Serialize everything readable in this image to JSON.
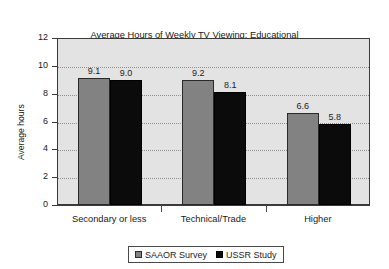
{
  "chart_data": {
    "type": "bar",
    "title": "Average Hours of Weekly TV Viewing: Educational\nComparisons in  SAAOR and USSR studies",
    "title_line1": "Average Hours of Weekly TV Viewing: Educational",
    "title_line2": "Comparisons in  SAAOR and USSR studies",
    "xlabel": "",
    "ylabel": "Average hours",
    "ylim": [
      0,
      12
    ],
    "ytick_labels": [
      "0",
      "2",
      "4",
      "6",
      "8",
      "10",
      "12"
    ],
    "ytick_values": [
      0,
      2,
      4,
      6,
      8,
      10,
      12
    ],
    "grid": true,
    "grid_axis": "y",
    "legend_position": "bottom",
    "categories": [
      "Secondary or less",
      "Technical/Trade",
      "Higher"
    ],
    "series": [
      {
        "name": "SAAOR Survey",
        "color": "#828282",
        "values": [
          9.1,
          9.0,
          6.6
        ],
        "labels": [
          "9.1",
          "9.2",
          "6.6"
        ]
      },
      {
        "name": "USSR Study",
        "color": "#0b0b0b",
        "values": [
          9.0,
          8.1,
          5.8
        ],
        "labels": [
          "9.0",
          "8.1",
          "5.8"
        ]
      }
    ],
    "data_points": [
      {
        "category": "Secondary or less",
        "SAAOR Survey": 9.1,
        "USSR Study": 9.0
      },
      {
        "category": "Technical/Trade",
        "SAAOR Survey": 9.2,
        "USSR Study": 8.1
      },
      {
        "category": "Higher",
        "SAAOR Survey": 6.6,
        "USSR Study": 5.8
      }
    ],
    "plot_background": "#e3e3e3",
    "figure_background": "#ffffff"
  }
}
